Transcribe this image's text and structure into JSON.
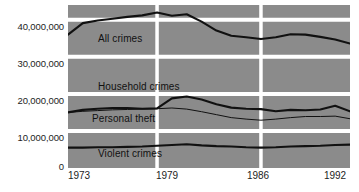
{
  "chart_data": {
    "type": "line",
    "title": "",
    "subtitle": "",
    "xlabel": "",
    "ylabel": "",
    "xlim": [
      1973,
      1992
    ],
    "ylim": [
      0,
      44000000
    ],
    "grid": true,
    "legend_position": "inline-annotations",
    "x": [
      1973,
      1974,
      1975,
      1976,
      1977,
      1978,
      1979,
      1980,
      1981,
      1982,
      1983,
      1984,
      1985,
      1986,
      1987,
      1988,
      1989,
      1990,
      1991,
      1992
    ],
    "x_tick_labels": [
      "1973",
      "1979",
      "1986",
      "1992"
    ],
    "x_tick_values": [
      1973,
      1979,
      1986,
      1992
    ],
    "y_tick_labels": [
      "40,000,000",
      "30,000,000",
      "20,000,000",
      "10,000,000",
      "0"
    ],
    "y_tick_values": [
      40000000,
      30000000,
      20000000,
      10000000,
      0
    ],
    "background_color": "#8b8b8b",
    "gridline_color": "#ffffff",
    "line_color": "#111111",
    "series": [
      {
        "name": "All crimes",
        "label": "All crimes",
        "style": "thick",
        "values": [
          36000000,
          39100000,
          39800000,
          40300000,
          40800000,
          41200000,
          42000000,
          41100000,
          41500000,
          39500000,
          37100000,
          35700000,
          35300000,
          34800000,
          35300000,
          36100000,
          36000000,
          35400000,
          34700000,
          33600000
        ]
      },
      {
        "name": "Household crimes",
        "label": "Household crimes",
        "style": "thick",
        "values": [
          15000000,
          15700000,
          16000000,
          16200000,
          16200000,
          16000000,
          16100000,
          18800000,
          19300000,
          18500000,
          17200000,
          16300000,
          16000000,
          15900000,
          15300000,
          15700000,
          15600000,
          15800000,
          16800000,
          15300000
        ]
      },
      {
        "name": "Personal theft",
        "label": "Personal theft",
        "style": "thin",
        "values": [
          15000000,
          15300000,
          15500000,
          15700000,
          15800000,
          15900000,
          16000000,
          16200000,
          15900000,
          15200000,
          14400000,
          13600000,
          13200000,
          12900000,
          13200000,
          13600000,
          13900000,
          13900000,
          14000000,
          13300000
        ]
      },
      {
        "name": "Violent crimes",
        "label": "Violent crimes",
        "style": "thick",
        "values": [
          5500000,
          5500000,
          5600000,
          5600000,
          5700000,
          5800000,
          6000000,
          6200000,
          6400000,
          6100000,
          5900000,
          5800000,
          5600000,
          5500000,
          5600000,
          5800000,
          5900000,
          6000000,
          6200000,
          6300000
        ]
      }
    ]
  },
  "axis": {
    "y_labels": [
      {
        "text": "40,000,000",
        "top": 27
      },
      {
        "text": "30,000,000",
        "top": 64
      },
      {
        "text": "20,000,000",
        "top": 101
      },
      {
        "text": "10,000,000",
        "top": 138
      },
      {
        "text": "0",
        "top": 163
      }
    ],
    "x_labels": [
      {
        "text": "1973",
        "left": 68
      },
      {
        "text": "1979",
        "left": 157
      },
      {
        "text": "1986",
        "left": 248
      },
      {
        "text": "1992",
        "left": 322
      }
    ]
  },
  "annotations": [
    {
      "name": "all-crimes",
      "text": "All crimes",
      "left": 98,
      "top": 33
    },
    {
      "name": "household-crimes",
      "text": "Household crimes",
      "left": 98,
      "top": 81
    },
    {
      "name": "personal-theft",
      "text": "Personal theft",
      "left": 92,
      "top": 113
    },
    {
      "name": "violent-crimes",
      "text": "Violent crimes",
      "left": 98,
      "top": 148
    }
  ]
}
